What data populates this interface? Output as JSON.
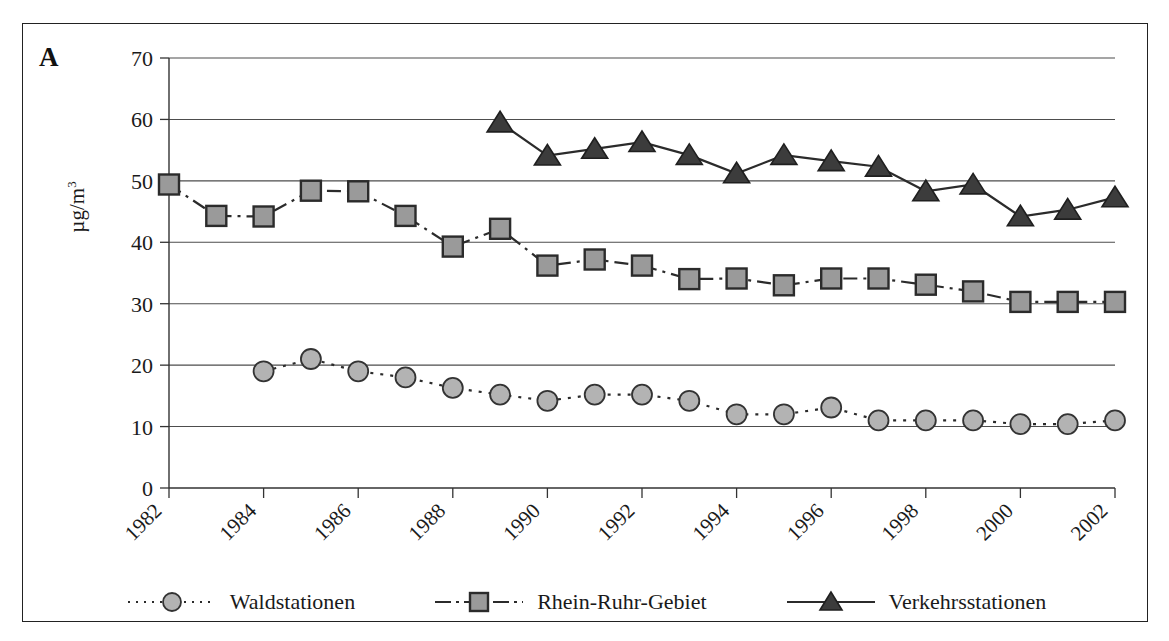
{
  "panel": {
    "label": "A"
  },
  "axes": {
    "ylabel": "µg/m",
    "ylabel_exponent": "3",
    "y_ticks": [
      "0",
      "10",
      "20",
      "30",
      "40",
      "50",
      "60",
      "70"
    ],
    "x_ticks": [
      "1982",
      "1984",
      "1986",
      "1988",
      "1990",
      "1992",
      "1994",
      "1996",
      "1998",
      "2000",
      "2002"
    ]
  },
  "legend": {
    "entries": [
      {
        "label": "Waldstationen",
        "marker": "circle-marker-icon",
        "line": "dotted"
      },
      {
        "label": "Rhein-Ruhr-Gebiet",
        "marker": "square-marker-icon",
        "line": "dash-dot"
      },
      {
        "label": "Verkehrsstationen",
        "marker": "triangle-marker-icon",
        "line": "solid"
      }
    ]
  },
  "colors": {
    "circle_fill": "#b3b3b3",
    "square_fill": "#9a9a9a",
    "triangle_fill": "#3c3c3c",
    "line": "#2b2b2b",
    "grid": "#4d4d4d",
    "frame": "#222222"
  },
  "chart_data": {
    "type": "line",
    "title": "",
    "xlabel": "",
    "ylabel": "µg/m3",
    "xlim": [
      1982,
      2002
    ],
    "ylim": [
      0,
      70
    ],
    "ytick_step": 10,
    "xtick_step": 2,
    "grid": "horizontal",
    "legend_position": "bottom",
    "x": [
      1982,
      1983,
      1984,
      1985,
      1986,
      1987,
      1988,
      1989,
      1990,
      1991,
      1992,
      1993,
      1994,
      1995,
      1996,
      1997,
      1998,
      1999,
      2000,
      2001,
      2002
    ],
    "series": [
      {
        "name": "Waldstationen",
        "marker": "circle",
        "line": "dotted",
        "x": [
          1984,
          1985,
          1986,
          1987,
          1988,
          1989,
          1990,
          1991,
          1992,
          1993,
          1994,
          1995,
          1996,
          1997,
          1998,
          1999,
          2000,
          2001,
          2002
        ],
        "values": [
          19.0,
          21.0,
          19.0,
          18.0,
          16.3,
          15.2,
          14.2,
          15.2,
          15.2,
          14.2,
          12.0,
          12.0,
          13.1,
          11.0,
          11.0,
          11.0,
          10.4,
          10.4,
          11.0
        ]
      },
      {
        "name": "Rhein-Ruhr-Gebiet",
        "marker": "square",
        "line": "dash-dot",
        "x": [
          1982,
          1983,
          1984,
          1985,
          1986,
          1987,
          1988,
          1989,
          1990,
          1991,
          1992,
          1993,
          1994,
          1995,
          1996,
          1997,
          1998,
          1999,
          2000,
          2001,
          2002
        ],
        "values": [
          49.4,
          44.3,
          44.2,
          48.4,
          48.3,
          44.3,
          39.3,
          42.2,
          36.2,
          37.2,
          36.2,
          34.0,
          34.1,
          33.0,
          34.1,
          34.1,
          33.1,
          32.0,
          30.3,
          30.3,
          30.3
        ]
      },
      {
        "name": "Verkehrsstationen",
        "marker": "triangle",
        "line": "solid",
        "x": [
          1989,
          1990,
          1991,
          1992,
          1993,
          1994,
          1995,
          1996,
          1997,
          1998,
          1999,
          2000,
          2001,
          2002
        ],
        "values": [
          59.5,
          54.1,
          55.2,
          56.3,
          54.2,
          51.2,
          54.2,
          53.2,
          52.3,
          48.3,
          49.4,
          44.2,
          45.3,
          47.3
        ]
      }
    ]
  }
}
